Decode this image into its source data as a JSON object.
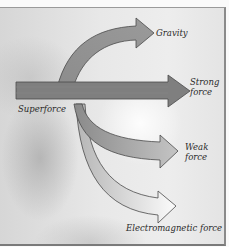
{
  "diagram": {
    "title": "",
    "source_label": "Superforce",
    "branches": [
      {
        "id": "gravity",
        "label": "Gravity",
        "fill": "#8f8f8f"
      },
      {
        "id": "strong",
        "label_line1": "Strong",
        "label_line2": "force",
        "fill": "#7d7d7d"
      },
      {
        "id": "weak",
        "label_line1": "Weak",
        "label_line2": "force",
        "fill": "#a9a9a9"
      },
      {
        "id": "electromagnetic",
        "label": "Electromagnetic force",
        "fill": "#efefef"
      }
    ],
    "colors": {
      "arrow_outline": "#4a4a4a",
      "text": "#2a2a2a",
      "background_light": "#ededed",
      "background_dark": "#bdbdbd"
    }
  }
}
